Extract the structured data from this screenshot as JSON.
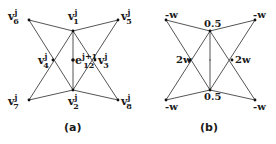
{
  "figure": {
    "panel_a": {
      "caption": "(a)",
      "base": "v",
      "sup": "j",
      "vertices": [
        {
          "id": "v1",
          "sub": "1",
          "x": 73,
          "y": 31
        },
        {
          "id": "v2",
          "sub": "2",
          "x": 73,
          "y": 90
        },
        {
          "id": "v3",
          "sub": "3",
          "x": 95,
          "y": 60
        },
        {
          "id": "v4",
          "sub": "4",
          "x": 53,
          "y": 60
        },
        {
          "id": "v5",
          "sub": "5",
          "x": 118,
          "y": 20
        },
        {
          "id": "v6",
          "sub": "6",
          "x": 29,
          "y": 20
        },
        {
          "id": "v7",
          "sub": "7",
          "x": 29,
          "y": 100
        },
        {
          "id": "v8",
          "sub": "8",
          "x": 118,
          "y": 100
        }
      ],
      "edge_point": {
        "base": "e",
        "sup": "j+1",
        "sub": "12",
        "x": 73,
        "y": 60
      }
    },
    "panel_b": {
      "caption": "(b)",
      "weights": {
        "v1": "0.5",
        "v2": "0.5",
        "v3": "2w",
        "v4": "2w",
        "v5": "-w",
        "v6": "-w",
        "v7": "-w",
        "v8": "-w"
      }
    }
  }
}
